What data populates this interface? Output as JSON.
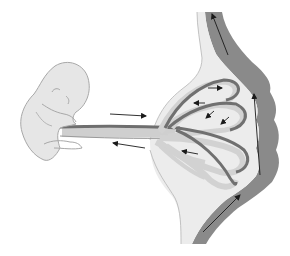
{
  "diagram": {
    "width": 290,
    "height": 256,
    "background": "#ffffff",
    "colors": {
      "embryo_fill": "#e6e6e6",
      "embryo_stroke": "#a8a8a8",
      "cord_dark": "#6e6e6e",
      "cord_light": "#cfcfcf",
      "cord_edge": "#9a9a9a",
      "villus_light": "#d2d2d2",
      "villus_dark": "#707070",
      "placenta_space": "#ececec",
      "placenta_edge": "#b5b5b5",
      "maternal_wall": "#8a8a8a",
      "arrow": "#1a1a1a"
    },
    "elements": {
      "embryo": {
        "label": "embryo",
        "visible_text": ""
      },
      "umbilical_cord": {
        "label": "umbilical-cord",
        "visible_text": ""
      },
      "chorionic_villi": {
        "label": "villi-loops",
        "count": 3
      },
      "intervillous_space": {
        "label": "intervillous-space"
      },
      "maternal_wall": {
        "label": "uterine-wall"
      }
    },
    "arrows": [
      {
        "id": "cord-inflow",
        "x1": 110,
        "y1": 114,
        "x2": 146,
        "y2": 116,
        "direction": "right"
      },
      {
        "id": "cord-outflow",
        "x1": 145,
        "y1": 148,
        "x2": 113,
        "y2": 143,
        "direction": "left"
      },
      {
        "id": "loop1-top",
        "x1": 208,
        "y1": 88,
        "x2": 222,
        "y2": 88,
        "direction": "right"
      },
      {
        "id": "loop1-inner",
        "x1": 205,
        "y1": 103,
        "x2": 194,
        "y2": 103,
        "direction": "left"
      },
      {
        "id": "loop2-a",
        "x1": 214,
        "y1": 111,
        "x2": 206,
        "y2": 118,
        "direction": "down-left"
      },
      {
        "id": "loop2-b",
        "x1": 229,
        "y1": 117,
        "x2": 221,
        "y2": 124,
        "direction": "down-left"
      },
      {
        "id": "loop3-inner",
        "x1": 198,
        "y1": 154,
        "x2": 182,
        "y2": 151,
        "direction": "left"
      },
      {
        "id": "maternal-top",
        "x1": 228,
        "y1": 55,
        "x2": 212,
        "y2": 14,
        "direction": "up"
      },
      {
        "id": "maternal-mid",
        "x1": 260,
        "y1": 175,
        "x2": 254,
        "y2": 94,
        "direction": "up"
      },
      {
        "id": "maternal-bottom",
        "x1": 203,
        "y1": 232,
        "x2": 240,
        "y2": 195,
        "direction": "up-right"
      }
    ]
  }
}
